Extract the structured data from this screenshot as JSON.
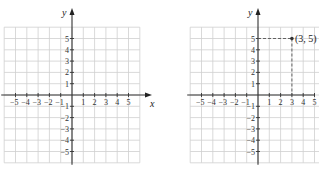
{
  "chart_data": [
    {
      "type": "scatter",
      "title": "",
      "xlabel": "x",
      "ylabel": "y",
      "xlim": [
        -6,
        6
      ],
      "ylim": [
        -6,
        6
      ],
      "grid": true,
      "x_tick_labels": [
        "−5",
        "−4",
        "−3",
        "−2",
        "−1",
        "1",
        "2",
        "3",
        "4",
        "5"
      ],
      "y_tick_labels": [
        "5",
        "4",
        "3",
        "2",
        "1",
        "−1",
        "−2",
        "−3",
        "−4",
        "−5"
      ],
      "points": []
    },
    {
      "type": "scatter",
      "title": "",
      "xlabel": "x",
      "ylabel": "y",
      "xlim": [
        -6,
        6
      ],
      "ylim": [
        -6,
        6
      ],
      "grid": true,
      "x_tick_labels": [
        "−5",
        "−4",
        "−3",
        "−2",
        "−1",
        "1",
        "2",
        "3",
        "4",
        "5"
      ],
      "y_tick_labels": [
        "5",
        "4",
        "3",
        "2",
        "1",
        "−1",
        "−2",
        "−3",
        "−4",
        "−5"
      ],
      "points": [
        {
          "x": 3,
          "y": 5,
          "label": "(3, 5)",
          "projection_lines": "dashed"
        }
      ]
    }
  ],
  "graphs": {
    "left": {
      "x_axis_label": "x",
      "y_axis_label": "y"
    },
    "right": {
      "y_axis_label": "y",
      "point_label": "(3, 5)"
    }
  }
}
